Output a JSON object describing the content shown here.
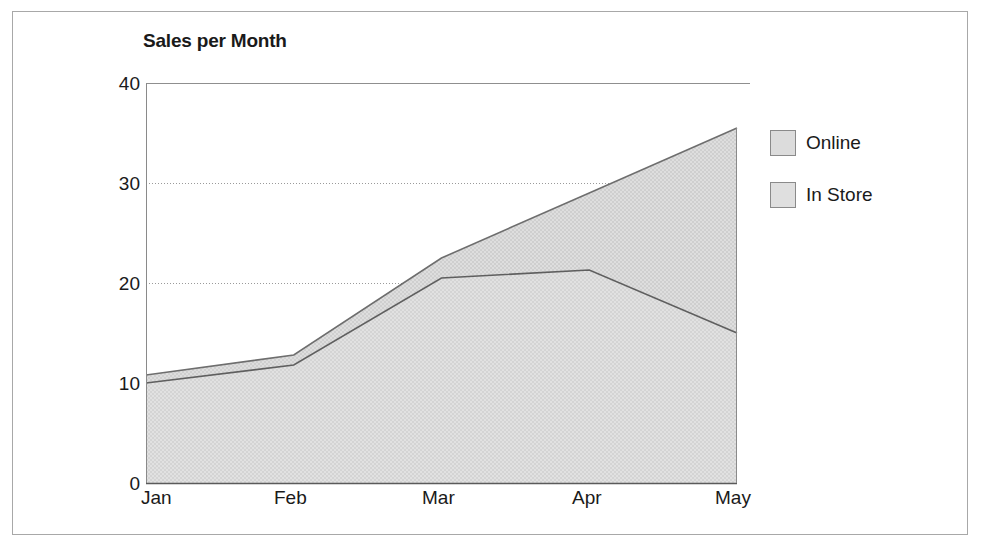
{
  "frame": {
    "border_color": "#a8a8a8"
  },
  "chart_data": {
    "type": "area",
    "title": "Sales per Month",
    "xlabel": "",
    "ylabel": "",
    "categories": [
      "Jan",
      "Feb",
      "Mar",
      "Apr",
      "May"
    ],
    "x_tick_labels": [
      "Jan",
      "Feb",
      "Mar",
      "Apr",
      "May"
    ],
    "y_tick_labels": [
      "0",
      "10",
      "20",
      "30",
      "40"
    ],
    "y_ticks": [
      0,
      10,
      20,
      30,
      40
    ],
    "ylim": [
      0,
      40
    ],
    "grid": true,
    "stacked": false,
    "legend_position": "right",
    "series": [
      {
        "name": "Online",
        "values": [
          10.8,
          12.8,
          22.5,
          29.0,
          35.5
        ],
        "fill_color": "#d9d9d9",
        "line_color": "#6b6b6b"
      },
      {
        "name": "In Store",
        "values": [
          10.0,
          11.8,
          20.5,
          21.3,
          15.0
        ],
        "fill_color": "#dcdcdc",
        "line_color": "#6b6b6b"
      }
    ]
  },
  "legend": {
    "items": [
      {
        "label": "Online",
        "color": "#d9d9d9"
      },
      {
        "label": "In Store",
        "color": "#dcdcdc"
      }
    ]
  }
}
